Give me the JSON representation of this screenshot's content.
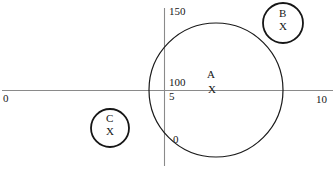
{
  "figure": {
    "background_color": "#ffffff",
    "stroke_color": "#1a1a1a",
    "axis_color": "#8a8a8a"
  },
  "axes": {
    "x_axis": {
      "min_label": "0",
      "max_label": "10"
    },
    "y_axis": {
      "ticks": [
        {
          "label": "150"
        },
        {
          "label": "100"
        },
        {
          "label": "5"
        },
        {
          "label": "0"
        }
      ]
    }
  },
  "chart_data": {
    "type": "scatter",
    "title": "",
    "xlabel": "",
    "ylabel": "",
    "xlim": [
      0,
      10
    ],
    "ylim": [
      0,
      150
    ],
    "grid": false,
    "legend": "none",
    "xtick_labels": [
      "0",
      "10"
    ],
    "ytick_labels": [
      "0",
      "5",
      "100",
      "150"
    ],
    "annotations": [
      "150",
      "100",
      "5",
      "0",
      "0",
      "10"
    ],
    "series": [
      {
        "name": "A",
        "marker": "X",
        "point_label": "A",
        "marker_label": "X",
        "cx": 216,
        "cy": 90,
        "r": 67,
        "stroke_width": 1.2
      },
      {
        "name": "B",
        "marker": "X",
        "point_label": "B",
        "marker_label": "X",
        "cx": 283,
        "cy": 23,
        "r": 20,
        "stroke_width": 1.8
      },
      {
        "name": "C",
        "marker": "X",
        "point_label": "C",
        "marker_label": "X",
        "cx": 110,
        "cy": 128,
        "r": 19,
        "stroke_width": 1.8
      }
    ]
  },
  "labels": {
    "x_origin": "0",
    "x_max": "10",
    "y_150": "150",
    "y_100": "100",
    "y_5": "5",
    "y_0": "0",
    "circle_a_name": "A",
    "circle_a_mark": "X",
    "circle_b_name": "B",
    "circle_b_mark": "X",
    "circle_c_name": "C",
    "circle_c_mark": "X"
  }
}
